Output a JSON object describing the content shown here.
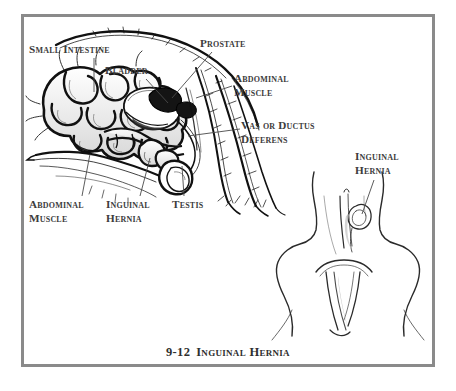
{
  "figure": {
    "caption_number": "9-12",
    "caption_title": "Inguinal Hernia",
    "border_color": "#8a8a8a",
    "background_color": "#ffffff",
    "ink_color": "#111111",
    "label_color": "#3c3c3c"
  },
  "labels": {
    "small_intestine": "Small Intestine",
    "bladder": "Bladder",
    "prostate": "Prostate",
    "abdominal_muscle_top_line1": "Abdominal",
    "abdominal_muscle_top_line2": "Muscle",
    "vas_line1": "Vas or Ductus",
    "vas_line2": "Deferens",
    "abdominal_muscle_bottom_line1": "Abdominal",
    "abdominal_muscle_bottom_line2": "Muscle",
    "inguinal_hernia_left_line1": "Inguinal",
    "inguinal_hernia_left_line2": "Hernia",
    "testis": "Testis",
    "inguinal_hernia_right_line1": "Inguinal",
    "inguinal_hernia_right_line2": "Hernia"
  },
  "diagrams": {
    "left": {
      "name": "lateral-view-male-abdomen",
      "structures": [
        "small-intestine-coils",
        "urinary-bladder",
        "prostate",
        "abdominal-muscle-wall",
        "vas-deferens",
        "inguinal-hernia-sac",
        "testis",
        "scrotum"
      ]
    },
    "right": {
      "name": "ventral-view-inguinal-region",
      "structures": [
        "inguinal-ring",
        "hernia-bulge",
        "pelvic-outline",
        "hind-limb-outline"
      ]
    }
  }
}
